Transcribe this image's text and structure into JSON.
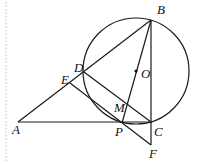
{
  "figure": {
    "type": "geometry",
    "circle": {
      "center": "O",
      "cx": 136,
      "cy": 71,
      "r": 53
    },
    "points": {
      "B": {
        "x": 151,
        "y": 20,
        "label": "B",
        "lx": 157,
        "ly": 14
      },
      "O": {
        "x": 136,
        "y": 71,
        "label": "O",
        "lx": 141,
        "ly": 78
      },
      "D": {
        "x": 84,
        "y": 72,
        "label": "D",
        "lx": 74,
        "ly": 72
      },
      "E": {
        "x": 70,
        "y": 83,
        "label": "E",
        "lx": 61,
        "ly": 84
      },
      "A": {
        "x": 18,
        "y": 122,
        "label": "A",
        "lx": 12,
        "ly": 134
      },
      "P": {
        "x": 122,
        "y": 123,
        "label": "P",
        "lx": 115,
        "ly": 136
      },
      "C": {
        "x": 151,
        "y": 122,
        "label": "C",
        "lx": 154,
        "ly": 136
      },
      "M": {
        "x": 127,
        "y": 104,
        "label": "M",
        "lx": 114,
        "ly": 112
      },
      "F": {
        "x": 151,
        "y": 145,
        "label": "F",
        "lx": 149,
        "ly": 158
      }
    },
    "segments": [
      [
        "A",
        "B"
      ],
      [
        "A",
        "C"
      ],
      [
        "B",
        "C"
      ],
      [
        "B",
        "P"
      ],
      [
        "D",
        "C"
      ],
      [
        "E",
        "F"
      ],
      [
        "C",
        "F"
      ]
    ]
  }
}
